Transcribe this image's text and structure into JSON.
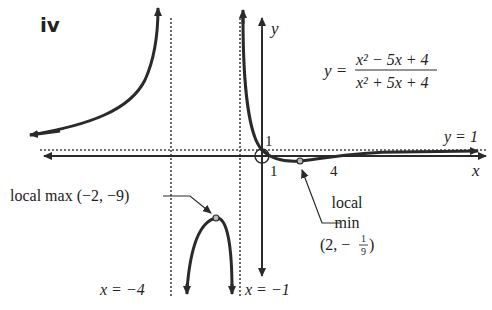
{
  "panel_label": "iv",
  "equation": {
    "lhs": "y =",
    "numerator": "x² − 5x + 4",
    "denominator": "x² + 5x + 4"
  },
  "axes": {
    "x_label": "x",
    "y_label": "y"
  },
  "asymptotes": {
    "horizontal": {
      "label": "y = 1",
      "value": 1
    },
    "vertical": [
      {
        "label": "x = −4",
        "value": -4
      },
      {
        "label": "x = −1",
        "value": -1
      }
    ]
  },
  "intercepts": {
    "y_intercept_label": "1",
    "x_intercepts": [
      "1",
      "4"
    ]
  },
  "annotations": {
    "local_max": {
      "label": "local max (−2, −9)",
      "x": -2,
      "y": -9
    },
    "local_min": {
      "line1": "local",
      "line2": "min",
      "line3_prefix": "(2, −",
      "frac_num": "1",
      "frac_den": "9",
      "line3_suffix": ")",
      "x": 2,
      "y": -0.111
    }
  },
  "colors": {
    "curve": "#2a2a2a",
    "axis": "#2a2a2a",
    "dotted": "#444444",
    "text": "#222222"
  }
}
